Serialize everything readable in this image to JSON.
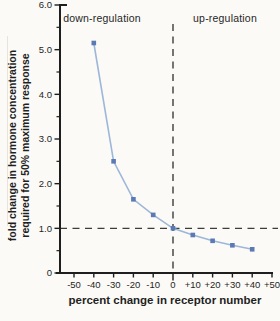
{
  "figure": {
    "background_color": "#fbfaf6"
  },
  "colors": {
    "line": "#9db7d9",
    "marker": "#5a79b5",
    "axis": "#1e1e1e",
    "dashed_line": "#3c3c3c",
    "text": "#1f1f1f"
  },
  "chart_data": {
    "type": "line",
    "title": "",
    "xlabel": "percent change in receptor number",
    "ylabel": "fold change in hormone concentration required for 50% maximum response",
    "ylabel_lines": [
      "fold change in hormone concentration",
      "required for 50% maximum response"
    ],
    "annotations": {
      "left_region": "down-regulation",
      "right_region": "up-regulation"
    },
    "x": [
      -40,
      -30,
      -20,
      -10,
      0,
      10,
      20,
      30,
      40
    ],
    "y": [
      5.15,
      2.5,
      1.65,
      1.3,
      1.0,
      0.85,
      0.72,
      0.62,
      0.53
    ],
    "xlim": [
      -50,
      50
    ],
    "ylim": [
      0,
      6
    ],
    "x_ticks": [
      -50,
      -40,
      -30,
      -20,
      -10,
      0,
      10,
      20,
      30,
      40,
      50
    ],
    "x_tick_labels": [
      "-50",
      "-40",
      "-30",
      "-20",
      "-10",
      "0",
      "+10",
      "+20",
      "+30",
      "+40",
      "+50"
    ],
    "y_ticks": [
      0,
      1,
      2,
      3,
      4,
      5,
      6
    ],
    "y_tick_labels": [
      "0",
      "1.0",
      "2.0",
      "3.0",
      "4.0",
      "5.0",
      "6.0"
    ],
    "y_minor_ticks": [
      0.5,
      1.5,
      2.5,
      3.5,
      4.5,
      5.5
    ],
    "reference_lines": {
      "vertical_at_x": 0,
      "horizontal_at_y": 1.0
    },
    "marker": "square",
    "grid": false
  }
}
